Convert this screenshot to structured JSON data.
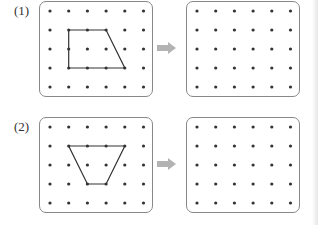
{
  "problems": [
    {
      "label": "(1)",
      "source_board": {
        "cols": 6,
        "rows": 5,
        "shape": [
          [
            1,
            1
          ],
          [
            3,
            1
          ],
          [
            4,
            3
          ],
          [
            1,
            3
          ]
        ]
      },
      "target_board": {
        "cols": 6,
        "rows": 5,
        "shape": []
      }
    },
    {
      "label": "(2)",
      "source_board": {
        "cols": 6,
        "rows": 5,
        "shape": [
          [
            1,
            1
          ],
          [
            4,
            1
          ],
          [
            3,
            3
          ],
          [
            2,
            3
          ]
        ]
      },
      "target_board": {
        "cols": 6,
        "rows": 5,
        "shape": []
      }
    }
  ],
  "arrow_icon": "right-arrow-icon",
  "colors": {
    "dot": "#333333",
    "line": "#333333",
    "border": "#888888",
    "arrow": "#b3b3b3"
  }
}
